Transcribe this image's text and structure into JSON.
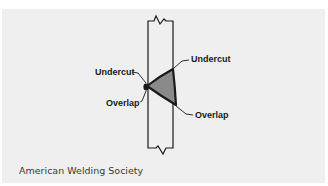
{
  "figure": {
    "type": "weld-defect-diagram",
    "labels": {
      "undercut_right": "Undercut",
      "undercut_left": "Undercut",
      "overlap_left": "Overlap",
      "overlap_right": "Overlap"
    },
    "caption": "American Welding Society",
    "colors": {
      "panel_background": "#efefef",
      "line": "#1a1a1a",
      "weld_fill": "#8a8a8a"
    }
  }
}
